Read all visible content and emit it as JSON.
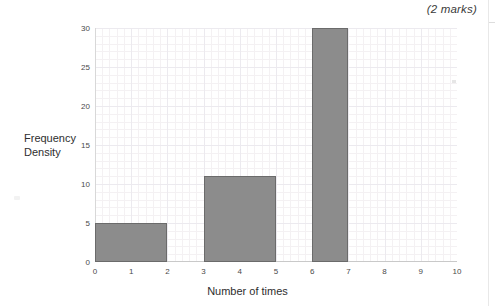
{
  "annotations": {
    "marks": "(2 marks)"
  },
  "chart_data": {
    "type": "bar",
    "title": "",
    "xlabel": "Number of times",
    "ylabel_line1": "Frequency",
    "ylabel_line2": "Density",
    "xlim": [
      0,
      10
    ],
    "ylim": [
      0,
      30
    ],
    "grid": true,
    "legend": "none",
    "x_ticks": [
      "0",
      "1",
      "2",
      "3",
      "4",
      "5",
      "6",
      "7",
      "8",
      "9",
      "10"
    ],
    "y_ticks": [
      "0",
      "5",
      "10",
      "15",
      "20",
      "25",
      "30"
    ],
    "bars": [
      {
        "label": "0-2",
        "x_start": 0,
        "x_end": 2,
        "value": 5
      },
      {
        "label": "3-5",
        "x_start": 3,
        "x_end": 5,
        "value": 11
      },
      {
        "label": "6-7",
        "x_start": 6,
        "x_end": 7,
        "value": 30
      }
    ],
    "colors": {
      "bar_fill": "#8c8c8c",
      "bar_stroke": "#6b6b6b",
      "grid_minor": "#f4f1f3",
      "grid_major": "#eceaef",
      "axis": "#c9c9c9",
      "text": "#2e2e2e"
    }
  }
}
